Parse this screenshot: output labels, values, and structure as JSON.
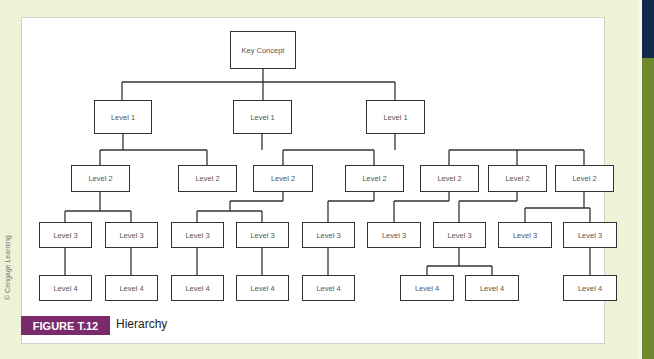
{
  "figure": {
    "label": "FIGURE T.12",
    "title": "Hierarchy",
    "credit": "© Cengage Learning"
  },
  "colors": {
    "background": "#eef3d8",
    "label_bg": "#7b2a6b",
    "side_dark": "#13294b",
    "side_green": "#6e8a2e"
  },
  "nodes": {
    "root": {
      "label": "Key Concept",
      "x": 230,
      "y": 31,
      "w": 66,
      "h": 38
    },
    "level1": [
      {
        "label": "Level 1",
        "x": 94,
        "y": 100,
        "w": 58,
        "h": 34
      },
      {
        "label": "Level 1",
        "x": 233,
        "y": 100,
        "w": 59,
        "h": 34
      },
      {
        "label": "Level 1",
        "x": 366,
        "y": 100,
        "w": 59,
        "h": 34
      }
    ],
    "level2": [
      {
        "label": "Level 2",
        "x": 71,
        "y": 165,
        "w": 59,
        "h": 27
      },
      {
        "label": "Level 2",
        "x": 178,
        "y": 165,
        "w": 59,
        "h": 27
      },
      {
        "label": "Level 2",
        "x": 253,
        "y": 165,
        "w": 60,
        "h": 27
      },
      {
        "label": "Level 2",
        "x": 345,
        "y": 165,
        "w": 59,
        "h": 27
      },
      {
        "label": "Level 2",
        "x": 420,
        "y": 165,
        "w": 59,
        "h": 27
      },
      {
        "label": "Level 2",
        "x": 488,
        "y": 165,
        "w": 59,
        "h": 27
      },
      {
        "label": "Level 2",
        "x": 555,
        "y": 165,
        "w": 59,
        "h": 27
      }
    ],
    "level3": [
      {
        "label": "Level 3",
        "x": 39,
        "y": 222,
        "w": 53,
        "h": 26
      },
      {
        "label": "Level 3",
        "x": 105,
        "y": 222,
        "w": 53,
        "h": 26
      },
      {
        "label": "Level 3",
        "x": 171,
        "y": 222,
        "w": 53,
        "h": 26
      },
      {
        "label": "Level 3",
        "x": 236,
        "y": 222,
        "w": 53,
        "h": 26
      },
      {
        "label": "Level 3",
        "x": 302,
        "y": 222,
        "w": 53,
        "h": 26
      },
      {
        "label": "Level 3",
        "x": 367,
        "y": 222,
        "w": 54,
        "h": 26
      },
      {
        "label": "Level 3",
        "x": 433,
        "y": 222,
        "w": 53,
        "h": 26
      },
      {
        "label": "Level 3",
        "x": 498,
        "y": 222,
        "w": 54,
        "h": 26
      },
      {
        "label": "Level 3",
        "x": 563,
        "y": 222,
        "w": 54,
        "h": 26
      }
    ],
    "level4": [
      {
        "label": "Level 4",
        "x": 39,
        "y": 275,
        "w": 53,
        "h": 26
      },
      {
        "label": "Level 4",
        "x": 105,
        "y": 275,
        "w": 53,
        "h": 26
      },
      {
        "label": "Level 4",
        "x": 171,
        "y": 275,
        "w": 53,
        "h": 26
      },
      {
        "label": "Level 4",
        "x": 236,
        "y": 275,
        "w": 53,
        "h": 26
      },
      {
        "label": "Level 4",
        "x": 302,
        "y": 275,
        "w": 53,
        "h": 26
      },
      {
        "label": "Level 4",
        "x": 400,
        "y": 275,
        "w": 54,
        "h": 26
      },
      {
        "label": "Level 4",
        "x": 465,
        "y": 275,
        "w": 54,
        "h": 26
      },
      {
        "label": "Level 4",
        "x": 563,
        "y": 275,
        "w": 54,
        "h": 26
      }
    ]
  },
  "connectors": [
    "M263 69 V82",
    "M122 82 H395",
    "M122 82 V100",
    "M263 82 V100",
    "M395 82 V100",
    "M123 134 V150",
    "M100 150 H207",
    "M100 150 V165",
    "M207 150 V165",
    "M262 134 V150",
    "M283 150 H374",
    "M283 150 V165",
    "M374 150 V165",
    "M395 134 V150",
    "M449 150 H584",
    "M449 150 V165",
    "M517 150 V165",
    "M584 150 V165",
    "M100 192 V211",
    "M65 211 H131",
    "M65 211 V222",
    "M131 211 V222",
    "M283 192 V201",
    "M230 201 H283",
    "M230 201 V211",
    "M197 211 H262",
    "M197 211 V222",
    "M262 211 V222",
    "M374 192 V201",
    "M328 201 H374",
    "M328 201 V222",
    "M449 192 V201",
    "M394 201 H449",
    "M394 201 V222",
    "M517 192 V201",
    "M459 201 H517",
    "M459 201 V222",
    "M584 192 V208",
    "M525 208 H590",
    "M525 208 V222",
    "M590 208 V222",
    "M65 248 V275",
    "M131 248 V275",
    "M197 248 V275",
    "M262 248 V275",
    "M328 248 V275",
    "M459 248 V266",
    "M427 266 H492",
    "M427 266 V275",
    "M492 266 V275",
    "M590 248 V275"
  ]
}
